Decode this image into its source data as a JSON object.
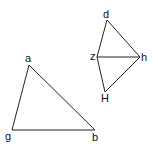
{
  "diagram": {
    "stroke_color": "#222222",
    "label_color": "#111111",
    "triangle_left": {
      "labels": {
        "a": "a",
        "g": "g",
        "b": "b"
      }
    },
    "figure_right": {
      "labels": {
        "d": "d",
        "z": "z",
        "h": "h",
        "H": "H"
      }
    }
  }
}
